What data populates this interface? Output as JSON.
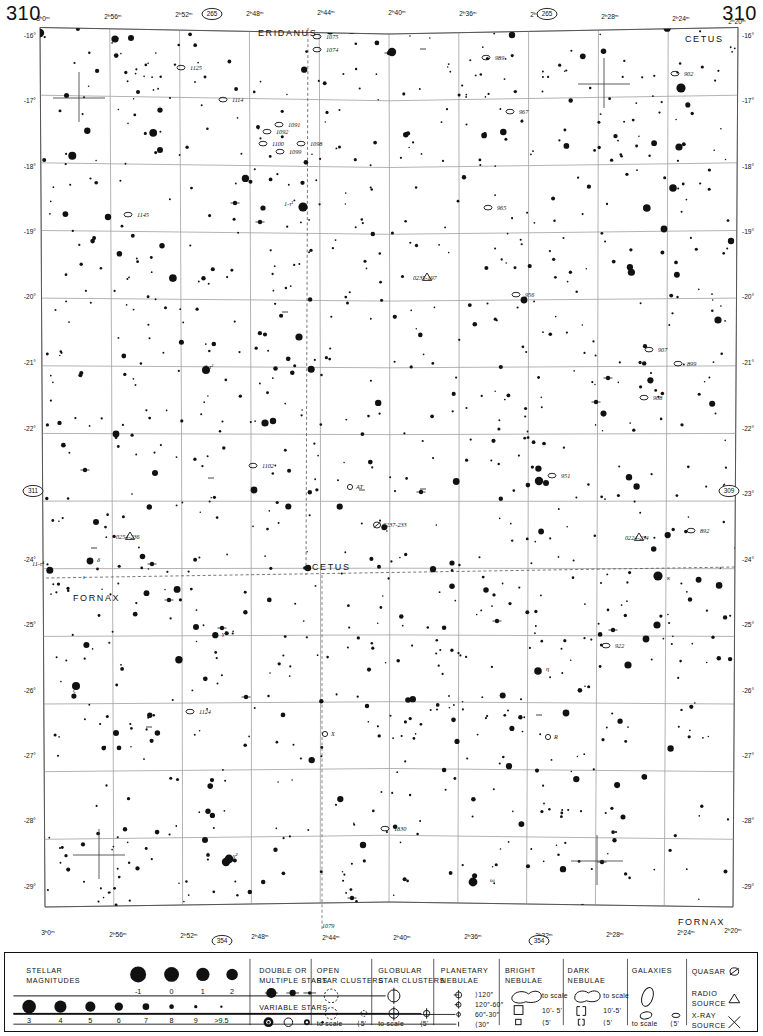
{
  "chart": {
    "page_number_left": "310",
    "page_number_right": "310",
    "neighbor_pages": [
      {
        "label": "265",
        "x": 212,
        "y": 14
      },
      {
        "label": "265",
        "x": 547,
        "y": 14
      },
      {
        "label": "311",
        "x": 33,
        "y": 491
      },
      {
        "label": "309",
        "x": 729,
        "y": 491
      },
      {
        "label": "354",
        "x": 222,
        "y": 941
      },
      {
        "label": "354",
        "x": 539,
        "y": 941
      }
    ],
    "ra_labels_top": [
      {
        "text": "3ʰ0ᵐ",
        "x": 43,
        "y": 21
      },
      {
        "text": "2ʰ56ᵐ",
        "x": 113,
        "y": 19
      },
      {
        "text": "2ʰ52ᵐ",
        "x": 184,
        "y": 17
      },
      {
        "text": "2ʰ48ᵐ",
        "x": 255,
        "y": 16
      },
      {
        "text": "2ʰ44ᵐ",
        "x": 326,
        "y": 15
      },
      {
        "text": "2ʰ40ᵐ",
        "x": 397,
        "y": 15
      },
      {
        "text": "2ʰ36ᵐ",
        "x": 468,
        "y": 16
      },
      {
        "text": "2ʰ32ᵐ",
        "x": 539,
        "y": 17
      },
      {
        "text": "2ʰ28ᵐ",
        "x": 610,
        "y": 19
      },
      {
        "text": "2ʰ24ᵐ",
        "x": 681,
        "y": 21
      },
      {
        "text": "2ʰ20ᵐ",
        "x": 737,
        "y": 24
      }
    ],
    "ra_labels_bottom": [
      {
        "text": "3ʰ0ᵐ",
        "x": 48,
        "y": 935
      },
      {
        "text": "2ʰ56ᵐ",
        "x": 118,
        "y": 937
      },
      {
        "text": "2ʰ52ᵐ",
        "x": 189,
        "y": 938
      },
      {
        "text": "2ʰ48ᵐ",
        "x": 260,
        "y": 939
      },
      {
        "text": "2ʰ44ᵐ",
        "x": 331,
        "y": 940
      },
      {
        "text": "2ʰ40ᵐ",
        "x": 402,
        "y": 940
      },
      {
        "text": "2ʰ36ᵐ",
        "x": 473,
        "y": 939
      },
      {
        "text": "2ʰ32ᵐ",
        "x": 544,
        "y": 938
      },
      {
        "text": "2ʰ28ᵐ",
        "x": 615,
        "y": 937
      },
      {
        "text": "2ʰ24ᵐ",
        "x": 686,
        "y": 935
      },
      {
        "text": "2ʰ20ᵐ",
        "x": 733,
        "y": 933
      }
    ],
    "dec_labels_left": [
      {
        "text": "-16°",
        "y": 36
      },
      {
        "text": "-17°",
        "y": 101
      },
      {
        "text": "-18°",
        "y": 167
      },
      {
        "text": "-19°",
        "y": 232
      },
      {
        "text": "-20°",
        "y": 297
      },
      {
        "text": "-21°",
        "y": 363
      },
      {
        "text": "-22°",
        "y": 429
      },
      {
        "text": "-23°",
        "y": 494
      },
      {
        "text": "-24°",
        "y": 560
      },
      {
        "text": "-25°",
        "y": 625
      },
      {
        "text": "-26°",
        "y": 691
      },
      {
        "text": "-27°",
        "y": 756
      },
      {
        "text": "-28°",
        "y": 821
      },
      {
        "text": "-29°",
        "y": 887
      }
    ],
    "dec_labels_right": [
      {
        "text": "-16°",
        "y": 36
      },
      {
        "text": "-17°",
        "y": 101
      },
      {
        "text": "-18°",
        "y": 167
      },
      {
        "text": "-19°",
        "y": 232
      },
      {
        "text": "-20°",
        "y": 297
      },
      {
        "text": "-21°",
        "y": 363
      },
      {
        "text": "-22°",
        "y": 429
      },
      {
        "text": "-23°",
        "y": 494
      },
      {
        "text": "-24°",
        "y": 560
      },
      {
        "text": "-25°",
        "y": 625
      },
      {
        "text": "-26°",
        "y": 691
      },
      {
        "text": "-27°",
        "y": 756
      },
      {
        "text": "-28°",
        "y": 821
      },
      {
        "text": "-29°",
        "y": 887
      }
    ],
    "constellations": [
      {
        "name": "ERIDANUS",
        "x": 258,
        "y": 36
      },
      {
        "name": "CETUS",
        "x": 685,
        "y": 42
      },
      {
        "name": "CETUS",
        "x": 312,
        "y": 570
      },
      {
        "name": "FORNAX",
        "x": 73,
        "y": 601
      },
      {
        "name": "FORNAX",
        "x": 678,
        "y": 925
      }
    ],
    "objects": [
      {
        "label": "1125",
        "x": 190,
        "y": 70,
        "type": "galaxy"
      },
      {
        "label": "1075",
        "x": 326,
        "y": 39,
        "type": "galaxy"
      },
      {
        "label": "1074",
        "x": 326,
        "y": 52,
        "type": "galaxy"
      },
      {
        "label": "989",
        "x": 495,
        "y": 60,
        "type": "galaxy"
      },
      {
        "label": "902",
        "x": 684,
        "y": 76,
        "type": "galaxy"
      },
      {
        "label": "1114",
        "x": 232,
        "y": 102,
        "type": "galaxy"
      },
      {
        "label": "967",
        "x": 519,
        "y": 114,
        "type": "galaxy"
      },
      {
        "label": "1091",
        "x": 288,
        "y": 127,
        "type": "galaxy"
      },
      {
        "label": "1092",
        "x": 276,
        "y": 134,
        "type": "galaxy"
      },
      {
        "label": "1100",
        "x": 272,
        "y": 146,
        "type": "galaxy"
      },
      {
        "label": "1098",
        "x": 310,
        "y": 146,
        "type": "galaxy"
      },
      {
        "label": "1099",
        "x": 289,
        "y": 154,
        "type": "galaxy"
      },
      {
        "label": "1145",
        "x": 137,
        "y": 217,
        "type": "galaxy"
      },
      {
        "label": "1-τ¹",
        "x": 284,
        "y": 206,
        "type": "star-label"
      },
      {
        "label": "965",
        "x": 497,
        "y": 210,
        "type": "galaxy"
      },
      {
        "label": "0235-197",
        "x": 413,
        "y": 280,
        "type": "radio-source"
      },
      {
        "label": "956",
        "x": 525,
        "y": 297,
        "type": "galaxy"
      },
      {
        "label": "2-τ²",
        "x": 204,
        "y": 369,
        "type": "star-label"
      },
      {
        "label": "907",
        "x": 658,
        "y": 352,
        "type": "galaxy"
      },
      {
        "label": "899",
        "x": 687,
        "y": 366,
        "type": "galaxy"
      },
      {
        "label": "908",
        "x": 653,
        "y": 400,
        "type": "galaxy"
      },
      {
        "label": "1102",
        "x": 262,
        "y": 468,
        "type": "galaxy"
      },
      {
        "label": "951",
        "x": 561,
        "y": 478,
        "type": "galaxy"
      },
      {
        "label": "AT",
        "x": 356,
        "y": 489,
        "type": "variable"
      },
      {
        "label": "0237-233",
        "x": 383,
        "y": 527,
        "type": "quasar"
      },
      {
        "label": "892",
        "x": 700,
        "y": 533,
        "type": "galaxy"
      },
      {
        "label": "0224-234",
        "x": 625,
        "y": 540,
        "type": "radio-source"
      },
      {
        "label": "0254-236",
        "x": 116,
        "y": 539,
        "type": "radio-source"
      },
      {
        "label": "11-τ⁴",
        "x": 32,
        "y": 566,
        "type": "star-label"
      },
      {
        "label": "δ",
        "x": 97,
        "y": 562,
        "type": "greek"
      },
      {
        "label": "ι",
        "x": 83,
        "y": 579,
        "type": "greek"
      },
      {
        "label": "κ",
        "x": 667,
        "y": 580,
        "type": "greek"
      },
      {
        "label": "γ¹",
        "x": 222,
        "y": 636,
        "type": "greek"
      },
      {
        "label": "922",
        "x": 615,
        "y": 648,
        "type": "galaxy"
      },
      {
        "label": "η",
        "x": 546,
        "y": 671,
        "type": "greek"
      },
      {
        "label": "ζ",
        "x": 73,
        "y": 692,
        "type": "greek"
      },
      {
        "label": "1124",
        "x": 199,
        "y": 714,
        "type": "galaxy"
      },
      {
        "label": "X",
        "x": 331,
        "y": 736,
        "type": "variable"
      },
      {
        "label": "R",
        "x": 554,
        "y": 739,
        "type": "variable"
      },
      {
        "label": "1830",
        "x": 394,
        "y": 831,
        "type": "galaxy"
      },
      {
        "label": "γ²",
        "x": 233,
        "y": 858,
        "type": "greek"
      },
      {
        "label": "ω",
        "x": 490,
        "y": 882,
        "type": "greek"
      },
      {
        "label": "1079",
        "x": 322,
        "y": 928,
        "type": "galaxy"
      }
    ]
  },
  "legend": {
    "sections": [
      {
        "id": "stellar-magnitudes",
        "title_line1": "STELLAR",
        "title_line2": "MAGNITUDES",
        "row1_labels": [
          "-1",
          "0",
          "1",
          "2"
        ],
        "row2_labels": [
          "3",
          "4",
          "5",
          "6",
          "7",
          "8",
          "9",
          ">9.5"
        ]
      },
      {
        "id": "double-multiple-stars",
        "title_line1": "DOUBLE  OR",
        "title_line2": "MULTIPLE  STARS",
        "subtitle": "VARIABLE  STARS"
      },
      {
        "id": "open-star-clusters",
        "title_line1": "OPEN",
        "title_line2": "STAR CLUSTERS",
        "caption_left": "to scale",
        "caption_right": "⟨5'"
      },
      {
        "id": "globular-star-clusters",
        "title_line1": "GLOBULAR",
        "title_line2": "STAR CLUSTERS",
        "caption_left": "to scale",
        "caption_right": "⟨5'"
      },
      {
        "id": "planetary-nebulae",
        "title_line1": "PLANETARY",
        "title_line2": "NEBULAE",
        "rows": [
          "⟩120″",
          "120″-60″",
          "60″-30″",
          "⟨30″"
        ]
      },
      {
        "id": "bright-nebulae",
        "title_line1": "BRIGHT",
        "title_line2": "NEBULAE",
        "rows": [
          "to scale",
          "10'- 5'",
          "⟨5'"
        ]
      },
      {
        "id": "dark-nebulae",
        "title_line1": "DARK",
        "title_line2": "NEBULAE",
        "rows": [
          "to scale",
          "10'-5'",
          "⟨5'"
        ]
      },
      {
        "id": "galaxies",
        "title_line1": "GALAXIES",
        "caption_left": "to scale",
        "caption_right": "⟨5'"
      },
      {
        "id": "other-objects",
        "rows": [
          "QUASAR",
          "RADIO",
          "SOURCE",
          "X-RAY",
          "SOURCE"
        ],
        "row_quasar": "QUASAR",
        "row_radio_l1": "RADIO",
        "row_radio_l2": "SOURCE",
        "row_xray_l1": "X-RAY",
        "row_xray_l2": "SOURCE"
      }
    ]
  },
  "colors": {
    "ink": "#111111",
    "grid": "#8a8a8a",
    "background": "#ffffff",
    "ecliptic": "#555555"
  }
}
